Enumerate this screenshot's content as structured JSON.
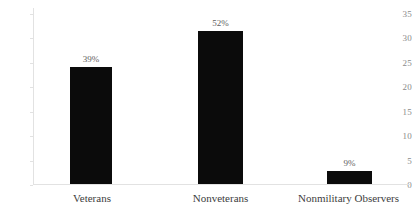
{
  "chart_data": {
    "type": "bar",
    "title": "",
    "subtitle": "",
    "xlabel": "",
    "ylabel": "",
    "categories": [
      "Veterans",
      "Nonveterans",
      "Nonmilitary Observers"
    ],
    "values": [
      23.3,
      30.5,
      2.5
    ],
    "data_labels": [
      "39%",
      "52%",
      "9%"
    ],
    "ylim": [
      0,
      35
    ],
    "ytick_labels": [
      "0",
      "5",
      "10",
      "15",
      "20",
      "25",
      "30",
      "35"
    ],
    "ytick_values": [
      0,
      5,
      10,
      15,
      20,
      25,
      30,
      35
    ],
    "grid": false,
    "legend": "none",
    "series": [
      {
        "name": "",
        "values": [
          23.3,
          30.5,
          2.5
        ],
        "color": "#0b0b0b"
      }
    ],
    "colors": {
      "bar": "#0b0b0b",
      "axis": "#e2e2e2",
      "tick_text": "#8a8a8a",
      "category_text": "#3d3d3d",
      "value_label_text": "#5e5e5e",
      "background": "#ffffff"
    }
  }
}
